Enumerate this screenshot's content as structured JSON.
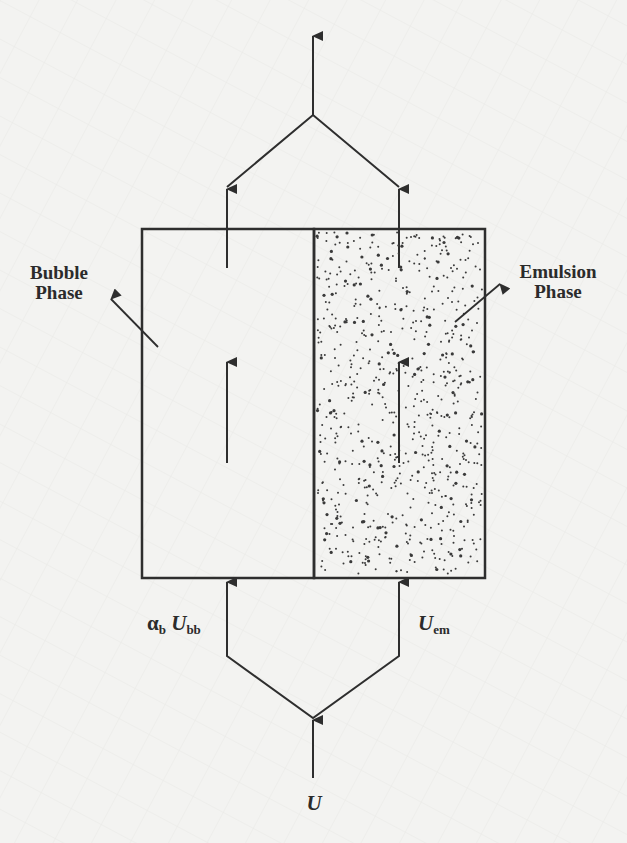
{
  "diagram": {
    "type": "two-phase fluidized bed model",
    "colors": {
      "background": "#f3f3f1",
      "line": "#2e2e2e",
      "dots": "#3a3a3a"
    },
    "phases": {
      "bubble": {
        "label_line1": "Bubble",
        "label_line2": "Phase"
      },
      "emulsion": {
        "label_line1": "Emulsion",
        "label_line2": "Phase"
      }
    },
    "flows": {
      "inlet": {
        "symbol": "U"
      },
      "bubble_inflow": {
        "alpha": "α",
        "alpha_sub": "b",
        "symbol": "U",
        "sub": "bb"
      },
      "emulsion_inflow": {
        "symbol": "U",
        "sub": "em"
      }
    }
  }
}
